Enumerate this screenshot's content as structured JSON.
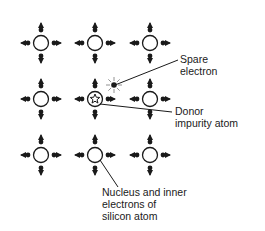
{
  "diagram": {
    "type": "n-type silicon crystal lattice with donor impurity",
    "colors": {
      "ink": "#1a1a1a",
      "background": "#ffffff"
    },
    "grid": {
      "columns_x": [
        41,
        95,
        150
      ],
      "rows_y": [
        43,
        99,
        155
      ],
      "atom_radius": 7.5
    },
    "atoms": [
      {
        "row": 0,
        "col": 0,
        "kind": "silicon"
      },
      {
        "row": 0,
        "col": 1,
        "kind": "silicon"
      },
      {
        "row": 0,
        "col": 2,
        "kind": "silicon"
      },
      {
        "row": 1,
        "col": 0,
        "kind": "silicon"
      },
      {
        "row": 1,
        "col": 1,
        "kind": "donor"
      },
      {
        "row": 1,
        "col": 2,
        "kind": "silicon"
      },
      {
        "row": 2,
        "col": 0,
        "kind": "silicon"
      },
      {
        "row": 2,
        "col": 1,
        "kind": "silicon"
      },
      {
        "row": 2,
        "col": 2,
        "kind": "silicon"
      }
    ],
    "spare_electron": {
      "x": 114,
      "y": 85
    },
    "labels": {
      "spare_electron": [
        "Spare",
        "electron"
      ],
      "donor": [
        "Donor",
        "impurity atom"
      ],
      "nucleus": [
        "Nucleus and inner",
        "electrons of",
        "silicon atom"
      ]
    }
  }
}
